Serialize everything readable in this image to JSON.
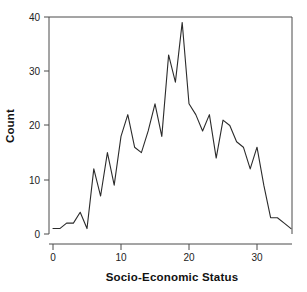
{
  "chart_data": {
    "type": "line",
    "title": "",
    "xlabel": "Socio-Economic Status",
    "ylabel": "Count",
    "xlim": [
      -1,
      36
    ],
    "ylim": [
      0,
      40
    ],
    "grid": false,
    "legend": null,
    "xticks": [
      0,
      10,
      20,
      30
    ],
    "xtick_labels": [
      "0",
      "10",
      "20",
      "30"
    ],
    "yticks": [
      0,
      10,
      20,
      30,
      40
    ],
    "ytick_labels": [
      "0",
      "10",
      "20",
      "30",
      "40"
    ],
    "line_color": "#2b2b2b",
    "x": [
      0,
      1,
      2,
      3,
      4,
      5,
      6,
      7,
      8,
      9,
      10,
      11,
      12,
      13,
      14,
      15,
      16,
      17,
      18,
      19,
      20,
      21,
      22,
      23,
      24,
      25,
      26,
      27,
      28,
      29,
      30,
      31,
      32,
      33,
      34,
      35
    ],
    "values": [
      1,
      1,
      2,
      2,
      4,
      1,
      12,
      7,
      15,
      9,
      18,
      22,
      16,
      15,
      19,
      24,
      18,
      33,
      28,
      39,
      24,
      22,
      19,
      22,
      14,
      21,
      20,
      17,
      16,
      12,
      16,
      9,
      3,
      3,
      2,
      1
    ],
    "series": [
      {
        "name": "Count",
        "values": [
          1,
          1,
          2,
          2,
          4,
          1,
          12,
          7,
          15,
          9,
          18,
          22,
          16,
          15,
          19,
          24,
          18,
          33,
          28,
          39,
          24,
          22,
          19,
          22,
          14,
          21,
          20,
          17,
          16,
          12,
          16,
          9,
          3,
          3,
          2,
          1
        ]
      }
    ]
  },
  "axes": {
    "x_title": "Socio-Economic Status",
    "y_title": "Count"
  }
}
